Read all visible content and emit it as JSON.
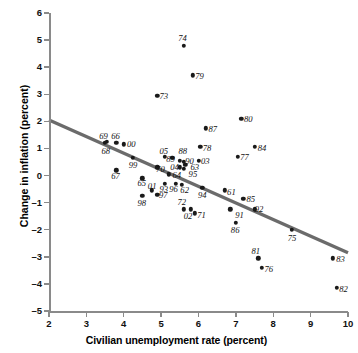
{
  "chart_data": {
    "type": "scatter",
    "title": "",
    "xlabel": "Civilian unemployment rate (percent)",
    "ylabel": "Change in inflation (percent)",
    "xlim": [
      2,
      10
    ],
    "ylim": [
      -5,
      6
    ],
    "xticks": [
      2,
      3,
      4,
      5,
      6,
      7,
      8,
      9,
      10
    ],
    "yticks": [
      -5,
      -4,
      -3,
      -2,
      -1,
      0,
      1,
      2,
      3,
      4,
      5,
      6
    ],
    "grid": false,
    "legend": null,
    "point_color": "#1a1a1a",
    "line_color": "#6b6b6b",
    "trend_line": {
      "label": "fitted Phillips curve",
      "x0": 2.0,
      "y0": 2.05,
      "x1": 10.0,
      "y1": -2.85
    },
    "points": [
      {
        "label": "61",
        "x": 6.7,
        "y": -0.55
      },
      {
        "label": "62",
        "x": 5.55,
        "y": -0.35
      },
      {
        "label": "63",
        "x": 5.65,
        "y": 0.4
      },
      {
        "label": "64",
        "x": 5.2,
        "y": 0.05
      },
      {
        "label": "65",
        "x": 4.5,
        "y": -0.1
      },
      {
        "label": "66",
        "x": 3.8,
        "y": 1.2
      },
      {
        "label": "67",
        "x": 3.8,
        "y": 0.2
      },
      {
        "label": "68",
        "x": 3.55,
        "y": 1.25
      },
      {
        "label": "69",
        "x": 3.5,
        "y": 1.2
      },
      {
        "label": "70",
        "x": 4.9,
        "y": 0.3
      },
      {
        "label": "71",
        "x": 5.9,
        "y": -1.4
      },
      {
        "label": "72",
        "x": 5.6,
        "y": -1.25
      },
      {
        "label": "73",
        "x": 4.9,
        "y": 2.95
      },
      {
        "label": "74",
        "x": 5.6,
        "y": 4.8
      },
      {
        "label": "75",
        "x": 8.5,
        "y": -2.0
      },
      {
        "label": "76",
        "x": 7.7,
        "y": -3.4
      },
      {
        "label": "77",
        "x": 7.05,
        "y": 0.7
      },
      {
        "label": "78",
        "x": 6.05,
        "y": 1.05
      },
      {
        "label": "79",
        "x": 5.85,
        "y": 3.7
      },
      {
        "label": "80",
        "x": 7.15,
        "y": 2.1
      },
      {
        "label": "81",
        "x": 7.6,
        "y": -3.05
      },
      {
        "label": "82",
        "x": 9.7,
        "y": -4.15
      },
      {
        "label": "83",
        "x": 9.6,
        "y": -3.05
      },
      {
        "label": "84",
        "x": 7.5,
        "y": 1.05
      },
      {
        "label": "85",
        "x": 7.2,
        "y": -0.85
      },
      {
        "label": "86",
        "x": 7.0,
        "y": -1.75
      },
      {
        "label": "87",
        "x": 6.2,
        "y": 1.75
      },
      {
        "label": "88",
        "x": 5.5,
        "y": 0.55
      },
      {
        "label": "89",
        "x": 5.3,
        "y": 0.65
      },
      {
        "label": "90",
        "x": 5.6,
        "y": 0.5
      },
      {
        "label": "91",
        "x": 6.85,
        "y": -1.25
      },
      {
        "label": "92",
        "x": 7.5,
        "y": -1.25
      },
      {
        "label": "93",
        "x": 5.1,
        "y": -0.3
      },
      {
        "label": "94",
        "x": 6.1,
        "y": -0.45
      },
      {
        "label": "95",
        "x": 5.6,
        "y": 0.25
      },
      {
        "label": "96",
        "x": 5.4,
        "y": -0.3
      },
      {
        "label": "97",
        "x": 4.9,
        "y": -0.7
      },
      {
        "label": "98",
        "x": 4.5,
        "y": -0.75
      },
      {
        "label": "99",
        "x": 4.25,
        "y": 0.65
      },
      {
        "label": "00",
        "x": 4.0,
        "y": 1.15
      },
      {
        "label": "01",
        "x": 4.75,
        "y": -0.55
      },
      {
        "label": "02",
        "x": 5.8,
        "y": -1.25
      },
      {
        "label": "03",
        "x": 6.0,
        "y": 0.55
      },
      {
        "label": "04",
        "x": 5.5,
        "y": 0.3
      },
      {
        "label": "05",
        "x": 5.1,
        "y": 0.7
      }
    ],
    "point_labels": [
      {
        "label": "61",
        "x": 6.88,
        "y": -0.62
      },
      {
        "label": "62",
        "x": 5.63,
        "y": -0.52
      },
      {
        "label": "63",
        "x": 5.9,
        "y": 0.3
      },
      {
        "label": "64",
        "x": 5.42,
        "y": 0.02
      },
      {
        "label": "65",
        "x": 4.48,
        "y": -0.28
      },
      {
        "label": "66",
        "x": 3.78,
        "y": 1.46
      },
      {
        "label": "67",
        "x": 3.78,
        "y": -0.02
      },
      {
        "label": "68",
        "x": 3.52,
        "y": 0.9
      },
      {
        "label": "69",
        "x": 3.46,
        "y": 1.46
      },
      {
        "label": "70",
        "x": 4.98,
        "y": 0.26
      },
      {
        "label": "71",
        "x": 6.08,
        "y": -1.46
      },
      {
        "label": "72",
        "x": 5.55,
        "y": -0.98
      },
      {
        "label": "73",
        "x": 5.07,
        "y": 2.92
      },
      {
        "label": "74",
        "x": 5.57,
        "y": 5.08
      },
      {
        "label": "75",
        "x": 8.5,
        "y": -2.3
      },
      {
        "label": "76",
        "x": 7.88,
        "y": -3.45
      },
      {
        "label": "77",
        "x": 7.23,
        "y": 0.67
      },
      {
        "label": "78",
        "x": 6.23,
        "y": 1.03
      },
      {
        "label": "79",
        "x": 6.03,
        "y": 3.67
      },
      {
        "label": "80",
        "x": 7.33,
        "y": 2.08
      },
      {
        "label": "81",
        "x": 7.53,
        "y": -2.78
      },
      {
        "label": "82",
        "x": 9.88,
        "y": -4.17
      },
      {
        "label": "83",
        "x": 9.8,
        "y": -3.07
      },
      {
        "label": "84",
        "x": 7.7,
        "y": 1.03
      },
      {
        "label": "85",
        "x": 7.4,
        "y": -0.87
      },
      {
        "label": "86",
        "x": 6.98,
        "y": -2.02
      },
      {
        "label": "87",
        "x": 6.38,
        "y": 1.73
      },
      {
        "label": "88",
        "x": 5.58,
        "y": 0.92
      },
      {
        "label": "89",
        "x": 5.25,
        "y": 0.62
      },
      {
        "label": "90",
        "x": 5.76,
        "y": 0.55
      },
      {
        "label": "91",
        "x": 7.1,
        "y": -1.45
      },
      {
        "label": "92",
        "x": 7.62,
        "y": -1.25
      },
      {
        "label": "93",
        "x": 5.07,
        "y": -0.48
      },
      {
        "label": "94",
        "x": 6.1,
        "y": -0.7
      },
      {
        "label": "95",
        "x": 5.85,
        "y": 0.05
      },
      {
        "label": "96",
        "x": 5.33,
        "y": -0.48
      },
      {
        "label": "97",
        "x": 5.06,
        "y": -0.73
      },
      {
        "label": "98",
        "x": 4.48,
        "y": -1.0
      },
      {
        "label": "99",
        "x": 4.25,
        "y": 0.38
      },
      {
        "label": "00",
        "x": 4.2,
        "y": 1.15
      },
      {
        "label": "01",
        "x": 4.76,
        "y": -0.4
      },
      {
        "label": "02",
        "x": 5.72,
        "y": -1.48
      },
      {
        "label": "03",
        "x": 6.18,
        "y": 0.55
      },
      {
        "label": "04",
        "x": 5.36,
        "y": 0.32
      },
      {
        "label": "05",
        "x": 5.07,
        "y": 0.9
      }
    ]
  }
}
